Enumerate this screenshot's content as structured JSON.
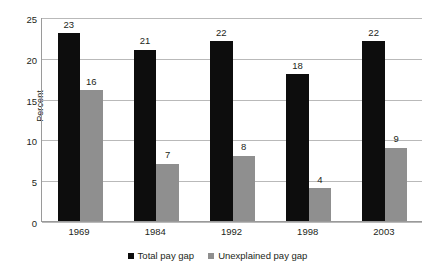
{
  "chart_data": {
    "type": "bar",
    "title": "",
    "xlabel": "",
    "ylabel": "Percent",
    "categories": [
      "1969",
      "1984",
      "1992",
      "1998",
      "2003"
    ],
    "series": [
      {
        "name": "Total pay gap",
        "color": "#0d0d0d",
        "values": [
          23,
          21,
          22,
          18,
          22
        ]
      },
      {
        "name": "Unexplained pay gap",
        "color": "#8f8f8f",
        "values": [
          16,
          7,
          8,
          4,
          9
        ]
      }
    ],
    "ylim": [
      0,
      25
    ],
    "yticks": [
      0,
      5,
      10,
      15,
      20,
      25
    ],
    "ytick_labels": [
      "0",
      "5",
      "10",
      "15",
      "20",
      "25"
    ],
    "grid": true,
    "grid_axis": "y",
    "legend_position": "bottom-center",
    "data_labels": true
  }
}
